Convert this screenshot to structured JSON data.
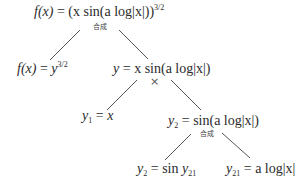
{
  "diagram": {
    "type": "function-decomposition-tree",
    "colors": {
      "text": "#2b2b2b",
      "edge": "#555555",
      "background": "#ffffff"
    },
    "root": {
      "lhs": "f(x)",
      "eq": "=",
      "expr": "(x sin(a log|x|))",
      "exponent": "3/2",
      "operation": "合成"
    },
    "level1": {
      "left": {
        "lhs": "f(x)",
        "eq": "=",
        "base": "y",
        "exponent": "3/2"
      },
      "right": {
        "lhs": "y",
        "eq": "=",
        "expr": "x sin(a log|x|)",
        "operation": "×"
      }
    },
    "level2": {
      "left": {
        "lhs": "y",
        "sub": "1",
        "eq": "=",
        "rhs": "x"
      },
      "right": {
        "lhs": "y",
        "sub": "2",
        "eq": "=",
        "rhs": "sin(a log|x|)",
        "operation": "合成"
      }
    },
    "level3": {
      "left": {
        "lhs": "y",
        "sub": "2",
        "eq": "=",
        "rhs_func": "sin",
        "rhs_var": "y",
        "rhs_sub": "21"
      },
      "right": {
        "lhs": "y",
        "sub": "21",
        "eq": "=",
        "rhs": "a log|x|"
      }
    }
  }
}
